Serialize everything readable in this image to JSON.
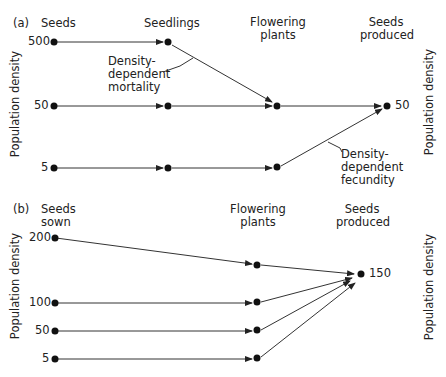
{
  "panel_a": {
    "label": "(a)",
    "stages": [
      "Seeds",
      "Seedlings",
      "Flowering plants",
      "Seeds produced"
    ],
    "stage_lines": {
      "seeds": "Seeds",
      "seedlings": "Seedlings",
      "flowering_1": "Flowering",
      "flowering_2": "plants",
      "produced_1": "Seeds",
      "produced_2": "produced"
    },
    "y_axis_left": "Population density",
    "y_axis_right": "Population density",
    "initial_values": [
      "500",
      "50",
      "5"
    ],
    "final_value": "50",
    "annotation_mortality": [
      "Density-",
      "dependent",
      "mortality"
    ],
    "annotation_fecundity": [
      "Density-",
      "dependent",
      "fecundity"
    ]
  },
  "panel_b": {
    "label": "(b)",
    "stages": [
      "Seeds sown",
      "Flowering plants",
      "Seeds produced"
    ],
    "stage_lines": {
      "sown_1": "Seeds",
      "sown_2": "sown",
      "flowering_1": "Flowering",
      "flowering_2": "plants",
      "produced_1": "Seeds",
      "produced_2": "produced"
    },
    "y_axis_left": "Population density",
    "y_axis_right": "Population density",
    "initial_values": [
      "200",
      "100",
      "50",
      "5"
    ],
    "final_value": "150"
  },
  "colors": {
    "line": "#333333",
    "dot": "#111111",
    "text": "#222222"
  }
}
